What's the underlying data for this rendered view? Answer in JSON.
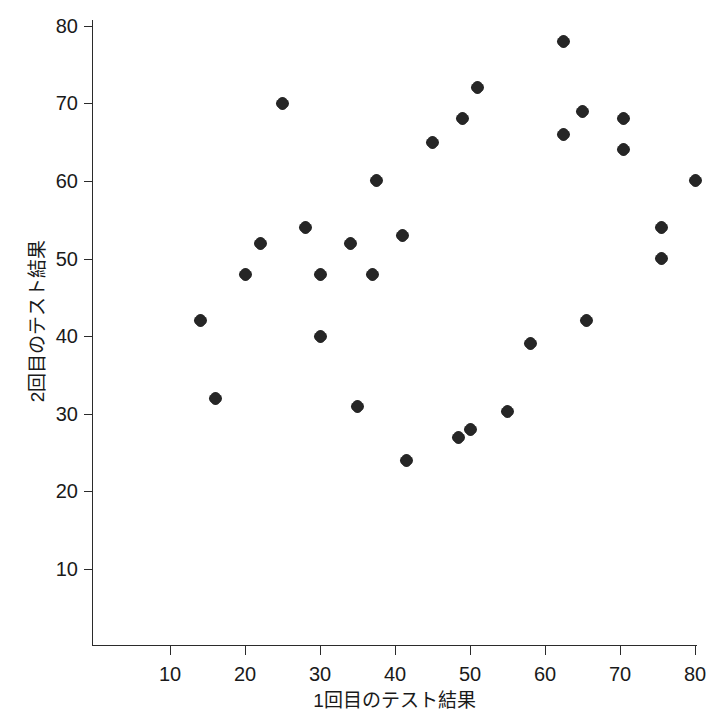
{
  "chart_data": {
    "type": "scatter",
    "title": "",
    "xlabel": "1回目のテスト結果",
    "ylabel": "2回目のテスト結果",
    "xlim": [
      0,
      80
    ],
    "ylim": [
      0,
      80
    ],
    "xticks": [
      10,
      20,
      30,
      40,
      50,
      60,
      70,
      80
    ],
    "xtick_labels": [
      "10",
      "20",
      "30",
      "40",
      "50",
      "60",
      "70",
      "80"
    ],
    "yticks": [
      10,
      20,
      30,
      40,
      50,
      60,
      70,
      80
    ],
    "ytick_labels": [
      "10",
      "20",
      "30",
      "40",
      "50",
      "60",
      "70",
      "80"
    ],
    "grid": false,
    "legend": false,
    "marker_color": "#262626",
    "axis_color": "#2b2b2b",
    "background_color": "#ffffff",
    "n_points": 30,
    "x": [
      14,
      16,
      20,
      22,
      25,
      28,
      30,
      30,
      34,
      35,
      37,
      37.5,
      41,
      41.5,
      45,
      48.5,
      49,
      50,
      51,
      55,
      58,
      62.5,
      62.5,
      65,
      65.5,
      70.5,
      70.5,
      75.5,
      75.5,
      80
    ],
    "y": [
      42,
      32,
      48,
      52,
      70,
      54,
      48,
      40,
      52,
      31,
      48,
      60,
      53,
      24,
      65,
      27,
      68,
      28,
      72,
      30.3,
      39,
      78,
      66,
      69,
      42,
      68,
      64,
      54,
      50,
      60
    ],
    "points": [
      {
        "x": 14,
        "y": 42
      },
      {
        "x": 16,
        "y": 32
      },
      {
        "x": 20,
        "y": 48
      },
      {
        "x": 22,
        "y": 52
      },
      {
        "x": 25,
        "y": 70
      },
      {
        "x": 28,
        "y": 54
      },
      {
        "x": 30,
        "y": 48
      },
      {
        "x": 30,
        "y": 40
      },
      {
        "x": 34,
        "y": 52
      },
      {
        "x": 35,
        "y": 31
      },
      {
        "x": 37,
        "y": 48
      },
      {
        "x": 37.5,
        "y": 60
      },
      {
        "x": 41,
        "y": 53
      },
      {
        "x": 41.5,
        "y": 24
      },
      {
        "x": 45,
        "y": 65
      },
      {
        "x": 48.5,
        "y": 27
      },
      {
        "x": 49,
        "y": 68
      },
      {
        "x": 50,
        "y": 28
      },
      {
        "x": 51,
        "y": 72
      },
      {
        "x": 55,
        "y": 30.3
      },
      {
        "x": 58,
        "y": 39
      },
      {
        "x": 62.5,
        "y": 78
      },
      {
        "x": 62.5,
        "y": 66
      },
      {
        "x": 65,
        "y": 69
      },
      {
        "x": 65.5,
        "y": 42
      },
      {
        "x": 70.5,
        "y": 68
      },
      {
        "x": 70.5,
        "y": 64
      },
      {
        "x": 75.5,
        "y": 54
      },
      {
        "x": 75.5,
        "y": 50
      },
      {
        "x": 80,
        "y": 60
      }
    ]
  },
  "geometry": {
    "x_px_at_10": 170,
    "x_px_per_unit": 7.5,
    "y_px_at_80": 25.7,
    "y_px_per_unit": 7.762
  }
}
